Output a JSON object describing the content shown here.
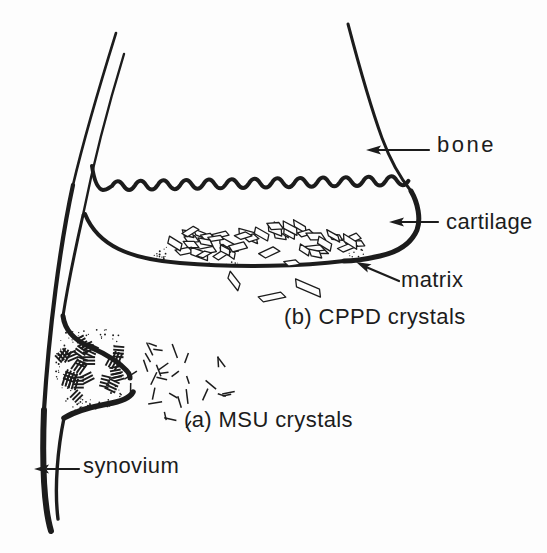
{
  "figure": {
    "ink": "#1c1c1c",
    "paper": "#fdfdfd",
    "labels": {
      "bone": "bone",
      "cartilage": "cartilage",
      "matrix": "matrix",
      "cppd": "(b) CPPD crystals",
      "msu": "(a) MSU crystals",
      "synovium": "synovium"
    }
  }
}
